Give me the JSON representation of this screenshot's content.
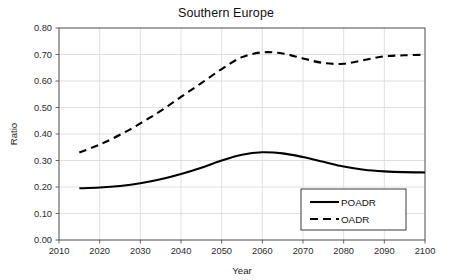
{
  "chart_data": {
    "type": "line",
    "title": "Southern Europe",
    "xlabel": "Year",
    "ylabel": "Ratio",
    "xlim": [
      2010,
      2100
    ],
    "ylim": [
      0.0,
      0.8
    ],
    "xticks": [
      "2010",
      "2020",
      "2030",
      "2040",
      "2050",
      "2060",
      "2070",
      "2080",
      "2090",
      "2100"
    ],
    "yticks": [
      "0.00",
      "0.10",
      "0.20",
      "0.30",
      "0.40",
      "0.50",
      "0.60",
      "0.70",
      "0.80"
    ],
    "grid": true,
    "legend_position": "bottom-right",
    "x": [
      2015,
      2020,
      2025,
      2030,
      2035,
      2040,
      2045,
      2050,
      2055,
      2060,
      2065,
      2070,
      2075,
      2080,
      2085,
      2090,
      2095,
      2100
    ],
    "series": [
      {
        "name": "POADR",
        "style": "solid",
        "color": "#000000",
        "values": [
          0.195,
          0.198,
          0.204,
          0.214,
          0.229,
          0.249,
          0.273,
          0.3,
          0.322,
          0.331,
          0.327,
          0.313,
          0.295,
          0.277,
          0.265,
          0.259,
          0.256,
          0.255
        ]
      },
      {
        "name": "OADR",
        "style": "dashed",
        "color": "#000000",
        "values": [
          0.33,
          0.36,
          0.397,
          0.44,
          0.487,
          0.54,
          0.592,
          0.645,
          0.69,
          0.708,
          0.704,
          0.685,
          0.668,
          0.665,
          0.679,
          0.693,
          0.697,
          0.699
        ]
      }
    ]
  },
  "legend": {
    "items": [
      {
        "label": "POADR"
      },
      {
        "label": "OADR"
      }
    ]
  }
}
